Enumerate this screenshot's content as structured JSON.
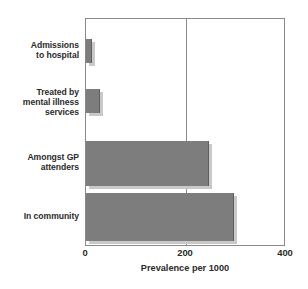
{
  "chart_data": {
    "type": "bar",
    "orientation": "horizontal",
    "title": "",
    "xlabel": "Prevalence per 1000",
    "ylabel": "",
    "categories": [
      "Admissions to hospital",
      "Treated by mental illness services",
      "Amongst GP attenders",
      "In community"
    ],
    "category_lines": [
      [
        "Admissions",
        "to hospital"
      ],
      [
        "Treated by",
        "mental illness",
        "services"
      ],
      [
        "Amongst GP",
        "attenders"
      ],
      [
        "In community"
      ]
    ],
    "values": [
      12,
      28,
      245,
      295
    ],
    "xlim": [
      0,
      400
    ],
    "xticks": [
      0,
      200,
      400
    ],
    "xtick_labels": [
      "0",
      "200",
      "400"
    ],
    "grid": "vertical-at-200",
    "legend": "none",
    "bar_color": "#7d7d7d",
    "bar_shadow_color": "#c9c9c9",
    "axis_color": "#8a8a8a",
    "text_color": "#2b2b2b",
    "background": "#ffffff"
  }
}
